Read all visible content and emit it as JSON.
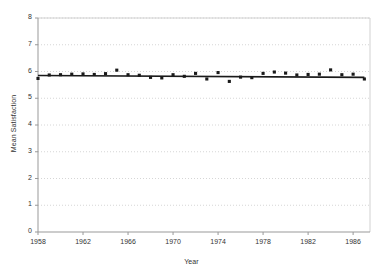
{
  "chart_data": {
    "type": "scatter",
    "title": "",
    "xlabel": "Year",
    "ylabel": "Mean Satisfaction",
    "xlim": [
      1958,
      1987.5
    ],
    "ylim": [
      0,
      8
    ],
    "xticks": [
      1958,
      1962,
      1966,
      1970,
      1974,
      1978,
      1982,
      1986
    ],
    "yticks": [
      0,
      1,
      2,
      3,
      4,
      5,
      6,
      7,
      8
    ],
    "grid": true,
    "grid_axis": "y",
    "legend": "none",
    "marker": "square",
    "marker_color": "#1a1a1a",
    "trendline": {
      "type": "linear",
      "color": "#1a1a1a",
      "start": {
        "x": 1958,
        "y": 5.85
      },
      "end": {
        "x": 1987,
        "y": 5.78
      }
    },
    "x": [
      1958,
      1959,
      1960,
      1961,
      1962,
      1963,
      1964,
      1965,
      1966,
      1967,
      1968,
      1969,
      1970,
      1971,
      1972,
      1973,
      1974,
      1975,
      1976,
      1977,
      1978,
      1979,
      1980,
      1981,
      1982,
      1983,
      1984,
      1985,
      1986,
      1987
    ],
    "values": [
      5.74,
      5.87,
      5.88,
      5.9,
      5.91,
      5.89,
      5.92,
      6.05,
      5.88,
      5.86,
      5.78,
      5.76,
      5.88,
      5.82,
      5.93,
      5.72,
      5.96,
      5.63,
      5.79,
      5.77,
      5.93,
      5.98,
      5.94,
      5.87,
      5.89,
      5.9,
      6.06,
      5.88,
      5.9,
      5.72
    ],
    "series": [
      {
        "name": "Mean Satisfaction",
        "values": [
          5.74,
          5.87,
          5.88,
          5.9,
          5.91,
          5.89,
          5.92,
          6.05,
          5.88,
          5.86,
          5.78,
          5.76,
          5.88,
          5.82,
          5.93,
          5.72,
          5.96,
          5.63,
          5.79,
          5.77,
          5.93,
          5.98,
          5.94,
          5.87,
          5.89,
          5.9,
          6.06,
          5.88,
          5.9,
          5.72
        ]
      }
    ],
    "xtick_labels": [
      "1958",
      "1962",
      "1966",
      "1970",
      "1974",
      "1978",
      "1982",
      "1986"
    ],
    "ytick_labels": [
      "0",
      "1",
      "2",
      "3",
      "4",
      "5",
      "6",
      "7",
      "8"
    ]
  },
  "style": {
    "axis_color": "#999999",
    "grid_color": "#cccccc",
    "text_color": "#333333",
    "background": "#ffffff"
  }
}
